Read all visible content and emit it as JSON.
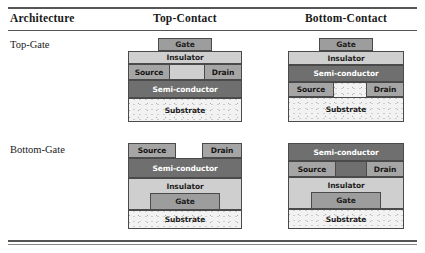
{
  "table": {
    "header": {
      "architecture": "Architecture",
      "top_contact": "Top-Contact",
      "bottom_contact": "Bottom-Contact"
    },
    "rows": [
      {
        "label": "Top-Gate"
      },
      {
        "label": "Bottom-Gate"
      }
    ]
  },
  "labels": {
    "gate": "Gate",
    "insulator": "Insulator",
    "semiconductor": "Semi-conductor",
    "source": "Source",
    "drain": "Drain",
    "substrate": "Substrate"
  },
  "colors": {
    "gate": "#9d9d9d",
    "insulator": "#cfcfcf",
    "semiconductor": "#6f6f6f",
    "contact": "#a5a5a5",
    "substrate": "#f2f2f2",
    "border": "#4a4a4a",
    "rule": "#555555"
  },
  "devices": {
    "top_gate_top_contact": {
      "name": "Top-Gate / Top-Contact",
      "stack_top_to_bottom": [
        "Gate",
        "Insulator",
        "Source",
        "Drain",
        "Semi-conductor",
        "Substrate"
      ]
    },
    "top_gate_bottom_contact": {
      "name": "Top-Gate / Bottom-Contact",
      "stack_top_to_bottom": [
        "Gate",
        "Insulator",
        "Semi-conductor",
        "Source",
        "Drain",
        "Substrate"
      ]
    },
    "bottom_gate_top_contact": {
      "name": "Bottom-Gate / Top-Contact",
      "stack_top_to_bottom": [
        "Source",
        "Drain",
        "Semi-conductor",
        "Insulator",
        "Gate",
        "Substrate"
      ]
    },
    "bottom_gate_bottom_contact": {
      "name": "Bottom-Gate / Bottom-Contact",
      "stack_top_to_bottom": [
        "Semi-conductor",
        "Source",
        "Drain",
        "Insulator",
        "Gate",
        "Substrate"
      ]
    }
  }
}
